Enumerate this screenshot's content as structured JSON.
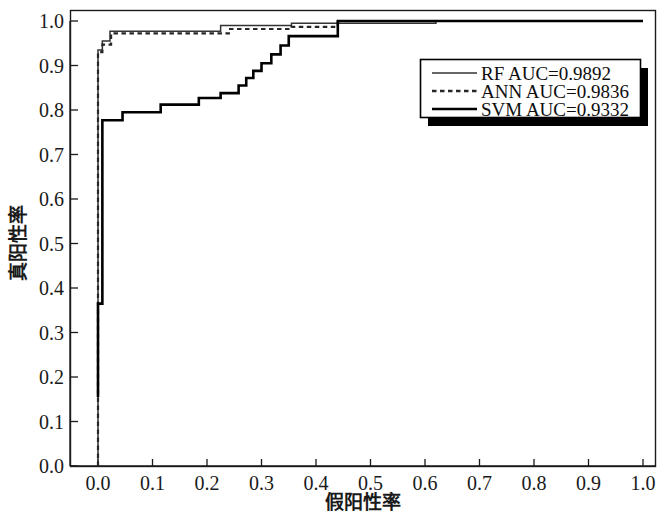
{
  "chart_data": {
    "type": "line",
    "title": "",
    "xlabel": "假阳性率",
    "ylabel": "真阳性率",
    "xlim": [
      0.0,
      1.0
    ],
    "ylim": [
      0.0,
      1.0
    ],
    "grid": false,
    "legend_position": "upper-right",
    "xticks": [
      "0.0",
      "0.1",
      "0.2",
      "0.3",
      "0.4",
      "0.5",
      "0.6",
      "0.7",
      "0.8",
      "0.9",
      "1.0"
    ],
    "xtick_values": [
      0.0,
      0.1,
      0.2,
      0.3,
      0.4,
      0.5,
      0.6,
      0.7,
      0.8,
      0.9,
      1.0
    ],
    "yticks": [
      "0.0",
      "0.1",
      "0.2",
      "0.3",
      "0.4",
      "0.5",
      "0.6",
      "0.7",
      "0.8",
      "0.9",
      "1.0"
    ],
    "ytick_values": [
      0.0,
      0.1,
      0.2,
      0.3,
      0.4,
      0.5,
      0.6,
      0.7,
      0.8,
      0.9,
      1.0
    ],
    "series": [
      {
        "name": "RF",
        "label": "RF  AUC=0.9892",
        "auc": 0.9892,
        "style": "solid-thin",
        "color": "#333333",
        "x": [
          0.0,
          0.0,
          0.008,
          0.008,
          0.022,
          0.022,
          0.225,
          0.225,
          0.355,
          0.355,
          0.62,
          0.62,
          1.0
        ],
        "y": [
          0.0,
          0.935,
          0.935,
          0.955,
          0.955,
          0.977,
          0.977,
          0.99,
          0.99,
          0.995,
          0.995,
          1.0,
          1.0
        ]
      },
      {
        "name": "ANN",
        "label": "ANN  AUC=0.9836",
        "auc": 0.9836,
        "style": "dotted",
        "color": "#262626",
        "x": [
          0.0,
          0.0,
          0.008,
          0.008,
          0.024,
          0.024,
          0.24,
          0.24,
          0.355,
          0.355,
          0.44,
          0.44,
          1.0
        ],
        "y": [
          0.0,
          0.93,
          0.93,
          0.947,
          0.947,
          0.972,
          0.972,
          0.982,
          0.982,
          0.987,
          0.987,
          1.0,
          1.0
        ]
      },
      {
        "name": "SVM",
        "label": "SVM  AUC=0.9332",
        "auc": 0.9332,
        "style": "solid-thick",
        "color": "#000000",
        "x": [
          0.0,
          0.0,
          0.008,
          0.008,
          0.045,
          0.045,
          0.115,
          0.115,
          0.185,
          0.185,
          0.225,
          0.225,
          0.258,
          0.258,
          0.272,
          0.272,
          0.285,
          0.285,
          0.3,
          0.3,
          0.318,
          0.318,
          0.335,
          0.335,
          0.35,
          0.35,
          0.44,
          0.44,
          1.0
        ],
        "y": [
          0.155,
          0.365,
          0.365,
          0.777,
          0.777,
          0.795,
          0.795,
          0.812,
          0.812,
          0.827,
          0.827,
          0.838,
          0.838,
          0.855,
          0.855,
          0.872,
          0.872,
          0.888,
          0.888,
          0.905,
          0.905,
          0.925,
          0.925,
          0.945,
          0.945,
          0.966,
          0.966,
          1.0,
          1.0
        ]
      }
    ]
  },
  "legend": {
    "items": [
      {
        "label": "RF  AUC=0.9892",
        "swatch": "solid-thin-line-icon"
      },
      {
        "label": "ANN  AUC=0.9836",
        "swatch": "dotted-line-icon"
      },
      {
        "label": "SVM  AUC=0.9332",
        "swatch": "solid-thick-line-icon"
      }
    ]
  },
  "colors": {
    "background": "#ffffff",
    "axis": "#1a1a1a",
    "rf": "#333333",
    "ann": "#262626",
    "svm": "#000000",
    "legend_border": "#000000",
    "legend_shadow": "#000000"
  }
}
